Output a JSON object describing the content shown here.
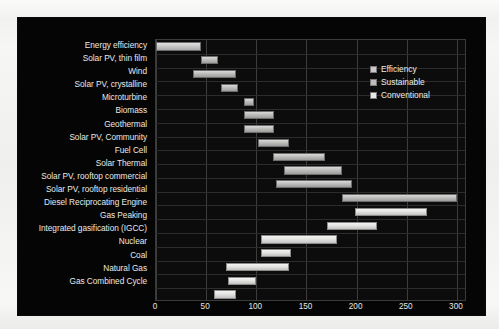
{
  "chart_data": {
    "type": "bar",
    "orientation": "horizontal",
    "subtype": "floating-range-bar",
    "title": "",
    "xlabel": "Cost ($/MWh)",
    "ylabel": "",
    "xlim": [
      0,
      310
    ],
    "xticks": [
      0,
      50,
      100,
      150,
      200,
      250,
      300
    ],
    "grid": true,
    "legend_position": "upper right",
    "legend": [
      {
        "name": "Efficiency",
        "color": "#c9c9c7"
      },
      {
        "name": "Sustainable",
        "color": "#bdbdbb"
      },
      {
        "name": "Conventional",
        "color": "#e8e8e6"
      }
    ],
    "categories": [
      "Energy efficiency",
      "Solar PV, thin film",
      "Wind",
      "Solar PV, crystalline",
      "Microturbine",
      "Biomass",
      "Geothermal",
      "Solar PV, Community",
      "Fuel Cell",
      "Solar Thermal",
      "Solar PV, rooftop commercial",
      "Solar PV, rooftop residential",
      "Diesel Reciprocating Engine",
      "Gas Peaking",
      "Integrated gasification (IGCC)",
      "Nuclear",
      "Coal",
      "Natural Gas",
      "Gas Combined Cycle"
    ],
    "bars": [
      {
        "label": "Energy efficiency",
        "low": 0,
        "high": 45,
        "series": "Efficiency"
      },
      {
        "label": "Solar PV, thin film",
        "low": 45,
        "high": 62,
        "series": "Sustainable"
      },
      {
        "label": "Wind",
        "low": 37,
        "high": 80,
        "series": "Sustainable"
      },
      {
        "label": "Solar PV, crystalline",
        "low": 65,
        "high": 82,
        "series": "Sustainable"
      },
      {
        "label": "Microturbine",
        "low": 88,
        "high": 98,
        "series": "Sustainable"
      },
      {
        "label": "Biomass",
        "low": 88,
        "high": 118,
        "series": "Sustainable"
      },
      {
        "label": "Geothermal",
        "low": 88,
        "high": 118,
        "series": "Sustainable"
      },
      {
        "label": "Solar PV, Community",
        "low": 102,
        "high": 133,
        "series": "Sustainable"
      },
      {
        "label": "Fuel Cell",
        "low": 117,
        "high": 168,
        "series": "Sustainable"
      },
      {
        "label": "Solar Thermal",
        "low": 128,
        "high": 185,
        "series": "Sustainable"
      },
      {
        "label": "Solar PV, rooftop commercial",
        "low": 120,
        "high": 195,
        "series": "Sustainable"
      },
      {
        "label": "Solar PV, rooftop residential",
        "low": 185,
        "high": 300,
        "series": "Sustainable"
      },
      {
        "label": "Diesel Reciprocating Engine",
        "low": 198,
        "high": 270,
        "series": "Conventional"
      },
      {
        "label": "Gas Peaking",
        "low": 170,
        "high": 220,
        "series": "Conventional"
      },
      {
        "label": "Integrated gasification (IGCC)",
        "low": 105,
        "high": 180,
        "series": "Conventional"
      },
      {
        "label": "Nuclear",
        "low": 105,
        "high": 135,
        "series": "Conventional"
      },
      {
        "label": "Coal",
        "low": 70,
        "high": 133,
        "series": "Conventional"
      },
      {
        "label": "Natural Gas",
        "low": 72,
        "high": 100,
        "series": "Conventional"
      },
      {
        "label": "Gas Combined Cycle",
        "low": 58,
        "high": 80,
        "series": "Conventional"
      }
    ]
  }
}
